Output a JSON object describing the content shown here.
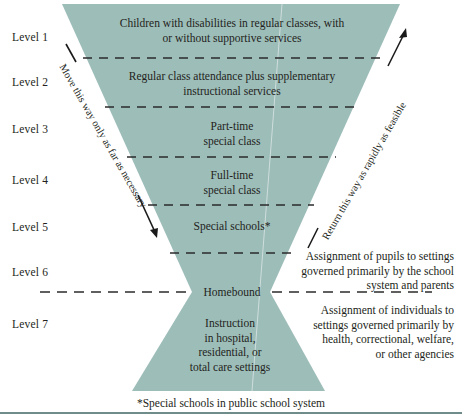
{
  "diagram": {
    "shape_color": "#9dbdb9",
    "line_color": "#2b2b2b",
    "rule_color": "#6f8c8a",
    "levels": [
      {
        "id": "level-1",
        "label": "Level 1"
      },
      {
        "id": "level-2",
        "label": "Level 2"
      },
      {
        "id": "level-3",
        "label": "Level 3"
      },
      {
        "id": "level-4",
        "label": "Level 4"
      },
      {
        "id": "level-5",
        "label": "Level 5"
      },
      {
        "id": "level-6",
        "label": "Level 6"
      },
      {
        "id": "level-7",
        "label": "Level 7"
      }
    ],
    "bands": [
      {
        "id": "band-1",
        "text": "Children with disabilities in regular classes, with\nor without supportive services"
      },
      {
        "id": "band-2",
        "text": "Regular class attendance plus supplementary\ninstructional services"
      },
      {
        "id": "band-3",
        "text": "Part-time\nspecial class"
      },
      {
        "id": "band-4",
        "text": "Full-time\nspecial class"
      },
      {
        "id": "band-5",
        "text": "Special schools*"
      },
      {
        "id": "band-6",
        "text": "Homebound"
      },
      {
        "id": "band-7",
        "text": "Instruction\nin hospital,\nresidential, or\ntotal care settings"
      }
    ],
    "arrows": {
      "left_label": "Move this way only as far as necessary",
      "right_label": "Return this way as rapidly as feasible"
    },
    "right_notes": [
      {
        "id": "note-school",
        "text": "Assignment of pupils to settings\ngoverned primarily by the school\nsystem and parents"
      },
      {
        "id": "note-agency",
        "text": "Assignment of individuals to\nsettings governed primarily by\nhealth, correctional, welfare,\nor other agencies"
      }
    ],
    "footnote": "*Special schools in public school system"
  }
}
